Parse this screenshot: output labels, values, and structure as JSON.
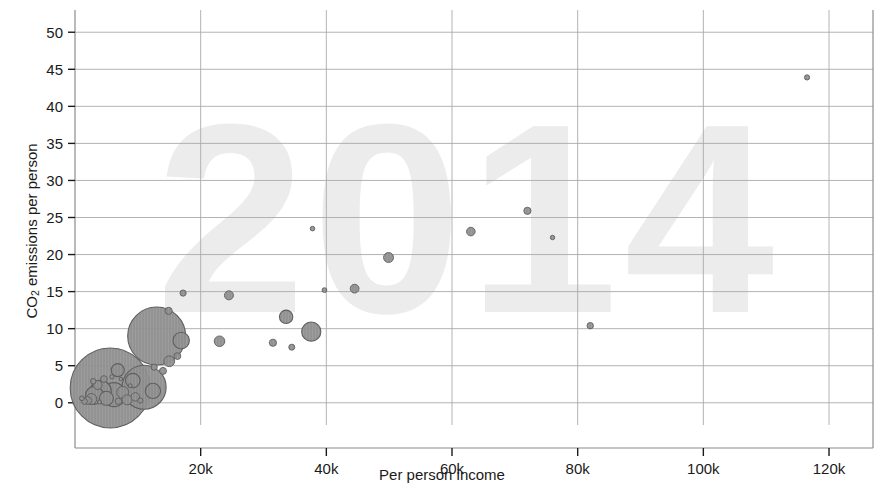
{
  "chart": {
    "title_watermark": "2014",
    "xlabel": "Per person income",
    "ylabel_main": "CO",
    "ylabel_sub": "2",
    "ylabel_rest": " emissions per person",
    "accent_bubble_fill": "#8d8d8d",
    "accent_bubble_stroke": "#5f5f5f",
    "grid_color": "#aaaaaa",
    "axis_color": "#8c8c8c",
    "watermark_color": "#ececed"
  },
  "chart_data": {
    "type": "scatter",
    "title": "2014",
    "xlabel": "Per person income",
    "ylabel": "CO2 emissions per person",
    "xlim": [
      0,
      127000
    ],
    "ylim": [
      -3,
      53
    ],
    "xticks": [
      20000,
      40000,
      60000,
      80000,
      100000,
      120000
    ],
    "xtick_labels": [
      "20k",
      "40k",
      "60k",
      "80k",
      "100k",
      "120k"
    ],
    "yticks": [
      0,
      5,
      10,
      15,
      20,
      25,
      30,
      35,
      40,
      45,
      50
    ],
    "ytick_labels": [
      "0",
      "5",
      "10",
      "15",
      "20",
      "25",
      "30",
      "35",
      "40",
      "45",
      "50"
    ],
    "grid": true,
    "legend": "none",
    "size_encoding": "population",
    "points": [
      {
        "x": 116500,
        "y": 43.9,
        "r": 2.6
      },
      {
        "x": 72000,
        "y": 25.9,
        "r": 3.6
      },
      {
        "x": 63000,
        "y": 23.1,
        "r": 4.3
      },
      {
        "x": 76000,
        "y": 22.3,
        "r": 2.2
      },
      {
        "x": 37800,
        "y": 23.5,
        "r": 2.3
      },
      {
        "x": 49900,
        "y": 19.6,
        "r": 5.0
      },
      {
        "x": 44500,
        "y": 15.4,
        "r": 4.4
      },
      {
        "x": 39700,
        "y": 15.2,
        "r": 2.4
      },
      {
        "x": 24500,
        "y": 14.5,
        "r": 4.5
      },
      {
        "x": 17200,
        "y": 14.8,
        "r": 3.1
      },
      {
        "x": 14900,
        "y": 12.4,
        "r": 3.6
      },
      {
        "x": 33600,
        "y": 11.6,
        "r": 6.7
      },
      {
        "x": 82000,
        "y": 10.4,
        "r": 3.2
      },
      {
        "x": 37600,
        "y": 9.6,
        "r": 9.6
      },
      {
        "x": 13000,
        "y": 9.0,
        "r": 29.0
      },
      {
        "x": 16900,
        "y": 8.4,
        "r": 8.2
      },
      {
        "x": 23000,
        "y": 8.3,
        "r": 5.3
      },
      {
        "x": 31500,
        "y": 8.1,
        "r": 3.6
      },
      {
        "x": 34500,
        "y": 7.5,
        "r": 3.0
      },
      {
        "x": 16300,
        "y": 6.3,
        "r": 3.4
      },
      {
        "x": 15000,
        "y": 5.6,
        "r": 5.4
      },
      {
        "x": 14000,
        "y": 4.3,
        "r": 3.5
      },
      {
        "x": 12600,
        "y": 4.8,
        "r": 3.1
      },
      {
        "x": 6800,
        "y": 4.4,
        "r": 6.5
      },
      {
        "x": 5600,
        "y": 2.0,
        "r": 40.0
      },
      {
        "x": 11000,
        "y": 2.1,
        "r": 22.0
      },
      {
        "x": 9200,
        "y": 3.0,
        "r": 7.2
      },
      {
        "x": 12400,
        "y": 1.6,
        "r": 7.6
      },
      {
        "x": 4100,
        "y": 1.6,
        "r": 10.5
      },
      {
        "x": 6200,
        "y": 1.1,
        "r": 12.0
      },
      {
        "x": 3100,
        "y": 1.0,
        "r": 9.0
      },
      {
        "x": 5000,
        "y": 0.6,
        "r": 7.0
      },
      {
        "x": 7600,
        "y": 1.4,
        "r": 6.0
      },
      {
        "x": 2600,
        "y": 0.5,
        "r": 5.5
      },
      {
        "x": 8300,
        "y": 0.4,
        "r": 5.0
      },
      {
        "x": 3600,
        "y": 2.4,
        "r": 4.5
      },
      {
        "x": 2000,
        "y": 0.3,
        "r": 4.0
      },
      {
        "x": 9600,
        "y": 0.8,
        "r": 4.2
      },
      {
        "x": 4600,
        "y": 3.2,
        "r": 3.4
      },
      {
        "x": 1500,
        "y": 0.2,
        "r": 3.0
      },
      {
        "x": 6900,
        "y": 0.2,
        "r": 3.2
      },
      {
        "x": 2900,
        "y": 2.9,
        "r": 2.8
      },
      {
        "x": 10400,
        "y": 0.3,
        "r": 2.6
      },
      {
        "x": 1100,
        "y": 0.6,
        "r": 2.4
      },
      {
        "x": 5900,
        "y": 3.5,
        "r": 2.2
      },
      {
        "x": 8800,
        "y": 2.3,
        "r": 2.0
      },
      {
        "x": 3900,
        "y": 0.1,
        "r": 2.0
      },
      {
        "x": 7300,
        "y": 3.2,
        "r": 1.8
      }
    ]
  }
}
